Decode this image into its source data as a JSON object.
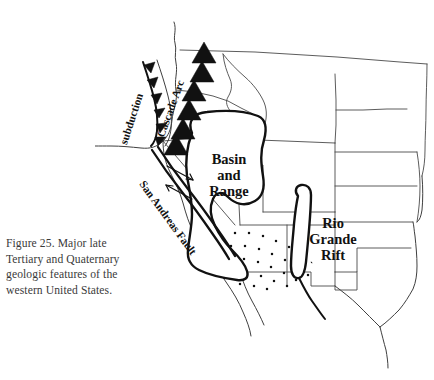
{
  "figure": {
    "caption_lines": [
      "Figure 25. Major late",
      "Tertiary and Quaternary",
      "geologic features of the",
      "western United States."
    ],
    "caption_full": "Figure 25. Major late Tertiary and Quaternary geologic features of the western United States.",
    "figure_number": "Figure 25."
  },
  "map": {
    "title": "Major late Tertiary and Quaternary geologic features of the western United States",
    "region": "western United States",
    "background_color": "#ffffff",
    "line_color": "#4a4a4a",
    "feature_color": "#111111",
    "labels": {
      "subduction": "subduction",
      "cascade_arc": "Cascade Arc",
      "san_andreas_fault": "San Andreas Fault",
      "basin_and_range_line1": "Basin",
      "basin_and_range_line2": "and",
      "basin_and_range_line3": "Range",
      "rio_grande_rift_line1": "Rio",
      "rio_grande_rift_line2": "Grande",
      "rio_grande_rift_line3": "Rift"
    },
    "features": [
      {
        "name": "subduction",
        "type": "subduction-zone",
        "symbol": "barbed-teeth",
        "label": "subduction"
      },
      {
        "name": "cascade-arc",
        "type": "volcanic-arc",
        "symbol": "black-triangles",
        "label": "Cascade Arc",
        "volcano_count": 6
      },
      {
        "name": "san-andreas-fault",
        "type": "strike-slip-fault",
        "symbol": "double-line-with-arrows",
        "label": "San Andreas Fault"
      },
      {
        "name": "basin-and-range",
        "type": "extensional-province",
        "symbol": "stippled-outline",
        "label": "Basin and Range"
      },
      {
        "name": "rio-grande-rift",
        "type": "continental-rift",
        "symbol": "stippled-outline",
        "label": "Rio Grande Rift"
      }
    ]
  }
}
